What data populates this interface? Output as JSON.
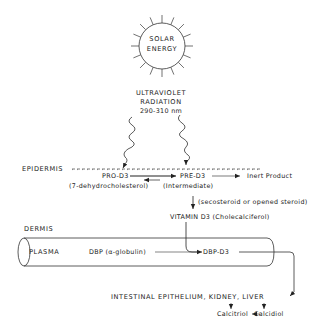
{
  "sun": {
    "line1": "SOLAR",
    "line2": "ENERGY"
  },
  "radiation": {
    "line1": "ULTRAVIOLET",
    "line2": "RADIATION",
    "range": "290-310 nm"
  },
  "epidermis": {
    "label": "EPIDERMIS",
    "pro": "PRO-D3",
    "pro_desc": "(7-dehydrocholesterol)",
    "pre": "PRE-D3",
    "pre_desc": "(Intermediate)",
    "inert": "Inert Product",
    "seco": "(secosteroid or opened steroid)",
    "vitamin": "VITAMIN D3 (Cholecalciferol)"
  },
  "dermis": {
    "label": "DERMIS",
    "plasma": "PLASMA",
    "dbp": "DBP (α-globulin)",
    "dbp_d3": "DBP-D3"
  },
  "targets": {
    "organs": "INTESTINAL EPITHELIUM, KIDNEY, LIVER",
    "calcitriol": "Calcitriol",
    "calcidiol": "Calcidiol"
  }
}
